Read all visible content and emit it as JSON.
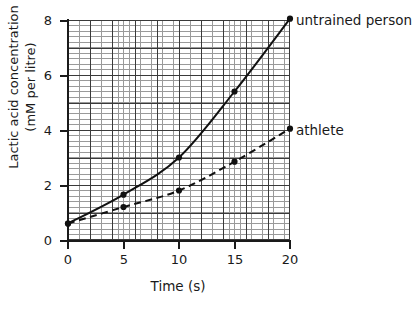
{
  "chart_data": {
    "type": "line",
    "title": "",
    "xlabel": "Time (s)",
    "ylabel": "Lactic acid concentration (mM per litre)",
    "ylabel_line1": "Lactic acid concentration",
    "ylabel_line2": "(mM per litre)",
    "x": [
      0,
      5,
      10,
      15,
      20
    ],
    "xlim": [
      0,
      20
    ],
    "ylim": [
      0,
      8
    ],
    "xticks": [
      "0",
      "5",
      "10",
      "15",
      "20"
    ],
    "yticks": [
      "0",
      "2",
      "4",
      "6",
      "8"
    ],
    "grid": "minor grid squares with major gridlines every 5 s and every 1 mM per litre",
    "legend_position": "right of curve endpoints",
    "series": [
      {
        "name": "untrained person",
        "style": "solid",
        "marker": "filled circle",
        "color": "#111111",
        "values": [
          0.6,
          1.65,
          3.0,
          5.4,
          8.05
        ]
      },
      {
        "name": "athlete",
        "style": "dashed",
        "marker": "filled circle",
        "color": "#111111",
        "values": [
          0.6,
          1.2,
          1.8,
          2.85,
          4.05
        ]
      }
    ]
  },
  "labels": {
    "untrained": "untrained person",
    "athlete": "athlete"
  },
  "axis": {
    "y0": "0",
    "y2": "2",
    "y4": "4",
    "y6": "6",
    "y8": "8",
    "x0": "0",
    "x5": "5",
    "x10": "10",
    "x15": "15",
    "x20": "20"
  }
}
